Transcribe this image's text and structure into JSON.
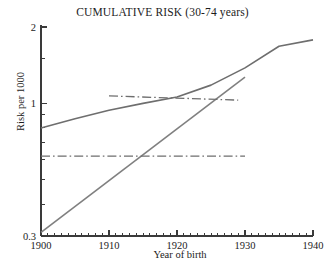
{
  "chart_data": {
    "type": "line",
    "title": "CUMULATIVE RISK (30-74 years)",
    "xlabel": "Year of birth",
    "ylabel": "Risk per 1000",
    "xlim": [
      1900,
      1940
    ],
    "ylim": [
      0.3,
      2
    ],
    "yscale": "log",
    "grid": false,
    "legend": null,
    "xticks_major": [
      1900,
      1910,
      1920,
      1930,
      1940
    ],
    "xtick_labels": [
      "1900",
      "1910",
      "1920",
      "1930",
      "1940"
    ],
    "xticks_minor_step": 1,
    "yticks_labeled": [
      0.3,
      1,
      2
    ],
    "ytick_labels": [
      "0.3",
      "1",
      "2"
    ],
    "yticks_minor": [
      0.4,
      0.5,
      0.6,
      0.7,
      0.8,
      0.9,
      1.5
    ],
    "series": [
      {
        "name": "cumulative-risk-curve",
        "style": "solid",
        "color": "#6e6e6e",
        "x": [
          1900,
          1905,
          1910,
          1915,
          1920,
          1925,
          1930,
          1935,
          1940
        ],
        "y": [
          0.8,
          0.87,
          0.94,
          1.0,
          1.06,
          1.18,
          1.38,
          1.68,
          1.78
        ]
      },
      {
        "name": "steep-trend-line",
        "style": "solid",
        "color": "#808080",
        "x": [
          1900,
          1930
        ],
        "y": [
          0.31,
          1.27
        ]
      },
      {
        "name": "upper-flat-line",
        "style": "dashdot",
        "color": "#6e6e6e",
        "x": [
          1910,
          1929
        ],
        "y": [
          1.07,
          1.03
        ]
      },
      {
        "name": "lower-flat-line",
        "style": "dashdot",
        "color": "#6e6e6e",
        "x": [
          1900,
          1930
        ],
        "y": [
          0.62,
          0.62
        ]
      }
    ]
  },
  "axes": {
    "title": "CUMULATIVE RISK (30-74 years)",
    "x_axis_label": "Year of birth",
    "y_axis_label": "Risk per 1000",
    "x_tick_1900": "1900",
    "x_tick_1910": "1910",
    "x_tick_1920": "1920",
    "x_tick_1930": "1930",
    "x_tick_1940": "1940",
    "y_tick_top": "2",
    "y_tick_mid": "1",
    "y_tick_bottom": "0.3"
  },
  "colors": {
    "background": "#ffffff",
    "axis": "#3a3a3a",
    "curve": "#6e6e6e",
    "text": "#1c1c1c"
  }
}
